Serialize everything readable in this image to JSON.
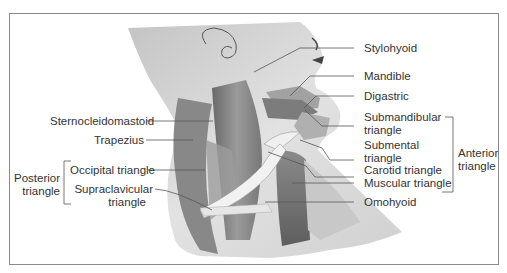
{
  "figure": {
    "colors": {
      "frame": "#8a8a8a",
      "text": "#333333",
      "leader": "#555555",
      "skin": "#d8d8d8",
      "muscle_dark": "#6e6e6e",
      "muscle_mid": "#8f8f8f",
      "muscle_light": "#b5b5b5",
      "tendon": "#eeeeee"
    }
  },
  "labels": {
    "left": {
      "sternocleidomastoid": "Sternocleidomastoid",
      "trapezius": "Trapezius",
      "occipital_triangle": "Occipital triangle",
      "supraclavicular_line1": "Supraclavicular",
      "supraclavicular_line2": "triangle",
      "group_posterior_line1": "Posterior",
      "group_posterior_line2": "triangle"
    },
    "right": {
      "stylohyoid": "Stylohyoid",
      "mandible": "Mandible",
      "digastric": "Digastric",
      "submandibular_line1": "Submandibular",
      "submandibular_line2": "triangle",
      "submental_line1": "Submental",
      "submental_line2": "triangle",
      "carotid_triangle": "Carotid triangle",
      "muscular_triangle": "Muscular triangle",
      "omohyoid": "Omohyoid",
      "group_anterior_line1": "Anterior",
      "group_anterior_line2": "triangle"
    }
  }
}
